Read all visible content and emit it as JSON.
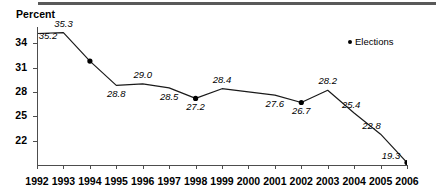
{
  "axis_title": "Percent",
  "legend": {
    "marker": "dot-icon",
    "label": "Elections"
  },
  "chart_data": {
    "type": "line",
    "title": "",
    "subtitle": "",
    "xlabel": "",
    "ylabel": "Percent",
    "grid": false,
    "legend_position": "top-right",
    "legend_entries": [
      "Elections"
    ],
    "xlim": [
      1992,
      2006
    ],
    "ylim": [
      19,
      36
    ],
    "yticks": [
      34,
      31,
      28,
      25,
      22
    ],
    "ytick_labels": [
      "34",
      "31",
      "28",
      "25",
      "22"
    ],
    "xticks": [
      1992,
      1993,
      1994,
      1995,
      1996,
      1997,
      1998,
      1999,
      2000,
      2001,
      2002,
      2003,
      2004,
      2005,
      2006
    ],
    "xtick_labels": [
      "1992",
      "1993",
      "1994",
      "1995",
      "1996",
      "1997",
      "1998",
      "1999",
      "2000",
      "2001",
      "2002",
      "2003",
      "2004",
      "2005",
      "2006"
    ],
    "categories": [
      1992,
      1993,
      1994,
      1995,
      1996,
      1997,
      1998,
      1999,
      2000,
      2001,
      2002,
      2003,
      2004,
      2005,
      2006
    ],
    "values": [
      35.2,
      35.3,
      31.8,
      28.8,
      29.0,
      28.5,
      27.2,
      28.4,
      28.0,
      27.6,
      26.7,
      28.2,
      25.4,
      22.8,
      19.3
    ],
    "point_labels": [
      "35.2",
      "35.3",
      "",
      "28.8",
      "29.0",
      "28.5",
      "27.2",
      "28.4",
      "",
      "27.6",
      "26.7",
      "28.2",
      "25.4",
      "22.8",
      "19.3"
    ],
    "election_years": [
      1994,
      1998,
      2002,
      2006
    ],
    "series": [
      {
        "name": "Elections",
        "marker": "filled-circle",
        "marked_points": [
          {
            "x": 1994,
            "y": 31.8
          },
          {
            "x": 1998,
            "y": 27.2
          },
          {
            "x": 2002,
            "y": 26.7
          },
          {
            "x": 2006,
            "y": 19.3
          }
        ]
      }
    ]
  }
}
